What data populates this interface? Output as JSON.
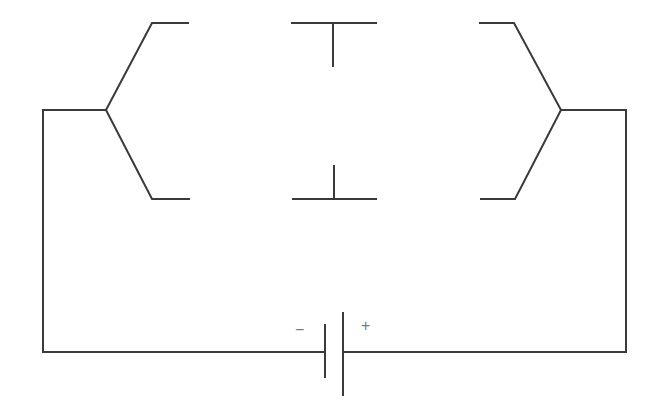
{
  "diagram": {
    "type": "circuit-schematic",
    "colors": {
      "line": "#3a3a3a",
      "sign": "#7a7a7a",
      "background": "#ffffff"
    },
    "components": [
      {
        "id": "battery",
        "kind": "cell",
        "negative_label": "−",
        "positive_label": "+"
      },
      {
        "id": "left-fork",
        "kind": "branch-contact",
        "side": "left"
      },
      {
        "id": "center-contacts",
        "kind": "gap-contacts",
        "side": "center"
      },
      {
        "id": "right-fork",
        "kind": "branch-contact",
        "side": "right"
      }
    ],
    "labels": {
      "negative": "−",
      "positive": "+"
    }
  }
}
